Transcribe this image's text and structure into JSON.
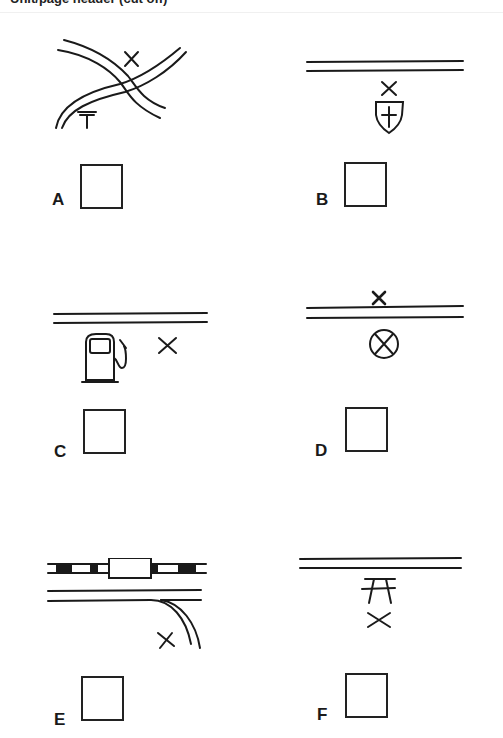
{
  "header": {
    "left_text": "Unit/page header (cut off)",
    "right_text": ""
  },
  "options": [
    {
      "letter": "A",
      "symbol": "crossroads-with-telephone",
      "description": "Crossroads with X near junction and telephone symbol"
    },
    {
      "letter": "B",
      "symbol": "church-shield",
      "description": "Road with X above a shield containing a cross"
    },
    {
      "letter": "C",
      "symbol": "petrol-station",
      "description": "Road with fuel pump and X to its right"
    },
    {
      "letter": "D",
      "symbol": "circle-cross",
      "description": "X above road with circled cross below"
    },
    {
      "letter": "E",
      "symbol": "level-crossing-station",
      "description": "Railway with station, road with side turning and X"
    },
    {
      "letter": "F",
      "symbol": "picnic-site",
      "description": "Road with picnic table and X below"
    }
  ],
  "colors": {
    "ink": "#1a1a1a",
    "background": "#ffffff"
  }
}
